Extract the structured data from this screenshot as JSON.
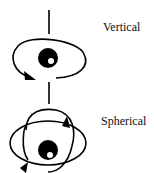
{
  "diagram": {
    "labels": {
      "vertical": "Vertical",
      "spherical": "Spherical"
    },
    "colors": {
      "stroke": "#000000",
      "background": "#ffffff"
    },
    "icons": {
      "vertical": "vertical-rotation-eye-icon",
      "spherical": "spherical-rotation-eye-icon"
    }
  }
}
